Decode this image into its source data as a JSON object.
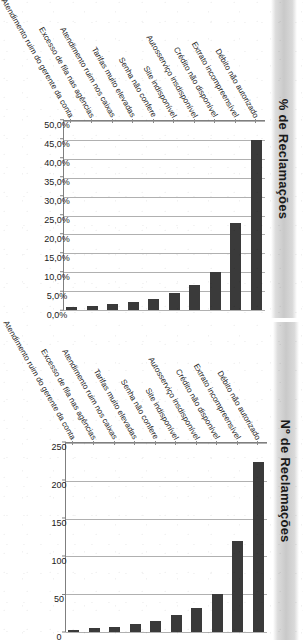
{
  "page": {
    "background_color": "#ffffff",
    "orientation_note": "rotated-90"
  },
  "charts": [
    {
      "id": "pct",
      "title": "% de Reclamações",
      "band_color": "#c9c9c9",
      "bar_color": "#3a3a3a"
    },
    {
      "id": "num",
      "title": "Nº de Reclamações",
      "band_color": "#c9c9c9",
      "bar_color": "#3a3a3a"
    }
  ],
  "chart_data": [
    {
      "type": "bar",
      "orientation": "horizontal",
      "title": "% de Reclamações",
      "xlabel": "",
      "ylabel": "",
      "xlim": [
        0,
        50
      ],
      "grid": true,
      "legend": "none",
      "categories": [
        "Débito não autorizado",
        "Extrato incompreensível",
        "Crédito não disponível",
        "Autosserviço insdisponível",
        "Site indisponível",
        "Senha não confere",
        "Tarifas muito elevadas",
        "Atendimento ruim nos caixas",
        "Excesso de fila nas agências",
        "Atendimento ruim do gerente da conta"
      ],
      "values": [
        45.0,
        23.0,
        10.0,
        6.5,
        4.5,
        3.0,
        2.0,
        1.5,
        1.0,
        0.7
      ],
      "tick_labels": [
        "50,0%",
        "45,0%",
        "40,0%",
        "35,0%",
        "30,0%",
        "25,0%",
        "20,0%",
        "15,0%",
        "10,0%",
        "5,0%",
        "0,0%"
      ],
      "tick_values": [
        50,
        45,
        40,
        35,
        30,
        25,
        20,
        15,
        10,
        5,
        0
      ]
    },
    {
      "type": "bar",
      "orientation": "horizontal",
      "title": "Nº de Reclamações",
      "xlabel": "",
      "ylabel": "",
      "xlim": [
        0,
        250
      ],
      "grid": true,
      "legend": "none",
      "categories": [
        "Débito não autorizado",
        "Extrato incompreensível",
        "Crédito não disponível",
        "Autosserviço insdisponível",
        "Site indisponível",
        "Senha não confere",
        "Tarifas muito elevadas",
        "Atendimento ruim nos caixas",
        "Excesso de fila nas agências",
        "Atendimento ruim do gerente da conta"
      ],
      "values": [
        225,
        120,
        50,
        32,
        22,
        15,
        10,
        7,
        5,
        3
      ],
      "tick_labels": [
        "250",
        "200",
        "150",
        "100",
        "50",
        "0"
      ],
      "tick_values": [
        250,
        200,
        150,
        100,
        50,
        0
      ]
    }
  ]
}
